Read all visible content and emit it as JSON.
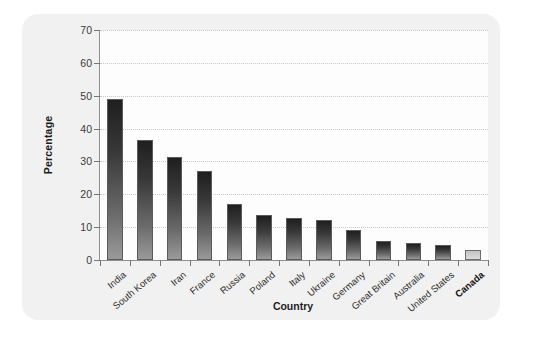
{
  "chart_data": {
    "type": "bar",
    "title": "",
    "xlabel": "Country",
    "ylabel": "Percentage",
    "ylim": [
      0,
      70
    ],
    "yticks": [
      0,
      10,
      20,
      30,
      40,
      50,
      60,
      70
    ],
    "grid": true,
    "legend": false,
    "categories": [
      "India",
      "South Korea",
      "Iran",
      "France",
      "Russia",
      "Poland",
      "Italy",
      "Ukraine",
      "Germany",
      "Great Britain",
      "Australia",
      "United States",
      "Canada"
    ],
    "values": [
      49,
      36.5,
      31.5,
      27,
      17,
      13.8,
      12.9,
      12.3,
      9,
      5.8,
      5.3,
      4.5,
      3
    ],
    "highlight_category": "Canada",
    "series": [
      {
        "name": "Percentage",
        "values": [
          49,
          36.5,
          31.5,
          27,
          17,
          13.8,
          12.9,
          12.3,
          9,
          5.8,
          5.3,
          4.5,
          3
        ]
      }
    ],
    "colors": {
      "bar_top": "#1f1f1f",
      "bar_bottom": "#9a9a9a",
      "highlight_bar": "#cfcfcf",
      "gridline": "#c9c9c9",
      "axis": "#8e8e8e",
      "card_background": "#f1f1f1",
      "plot_background": "#fdfdfd",
      "text": "#2e2e2e"
    }
  }
}
